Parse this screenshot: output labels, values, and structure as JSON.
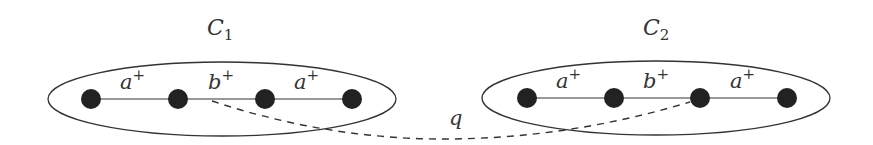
{
  "diagram": {
    "clusters": [
      {
        "name": "C",
        "subscript": "1",
        "edges": [
          {
            "label": "a",
            "sup": "+"
          },
          {
            "label": "b",
            "sup": "+"
          },
          {
            "label": "a",
            "sup": "+"
          }
        ]
      },
      {
        "name": "C",
        "subscript": "2",
        "edges": [
          {
            "label": "a",
            "sup": "+"
          },
          {
            "label": "b",
            "sup": "+"
          },
          {
            "label": "a",
            "sup": "+"
          }
        ]
      }
    ],
    "path_label": "q",
    "colors": {
      "node": "#222222",
      "line": "#333333",
      "background": "#ffffff"
    }
  }
}
